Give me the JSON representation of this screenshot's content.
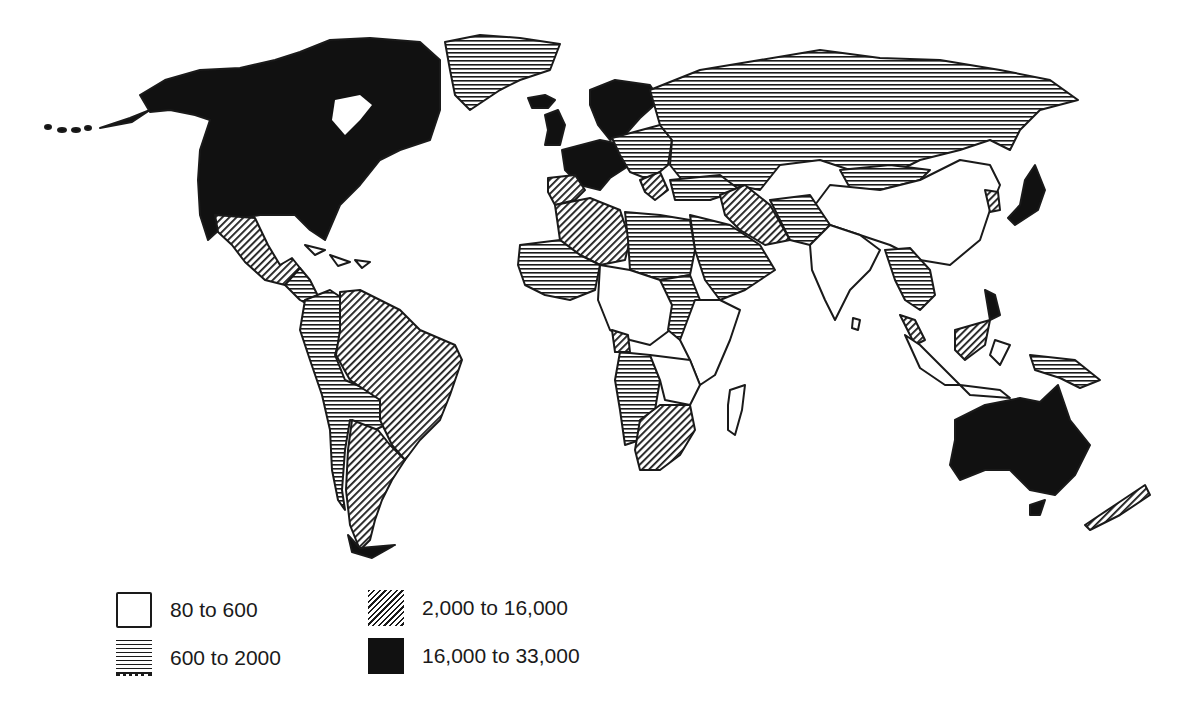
{
  "map": {
    "type": "choropleth world map",
    "classes": [
      {
        "id": "c1",
        "label": "80 to 600",
        "fill": "white",
        "color": "#ffffff"
      },
      {
        "id": "c2",
        "label": "600 to 2000",
        "fill": "horizontal-hatch",
        "color": "#1a1a1a"
      },
      {
        "id": "c3",
        "label": "2,000 to 16,000",
        "fill": "diagonal-hatch",
        "color": "#1a1a1a"
      },
      {
        "id": "c4",
        "label": "16,000 to 33,000",
        "fill": "solid-black",
        "color": "#111111"
      }
    ],
    "regions": {
      "north_america_us_canada": "16,000 to 33,000",
      "greenland": "600 to 2000",
      "mexico": "2,000 to 16,000",
      "central_america": "600 to 2000",
      "colombia_peru_bolivia": "600 to 2000",
      "brazil_venezuela": "2,000 to 16,000",
      "argentina_chile_uruguay": "2,000 to 16,000",
      "western_europe_scandinavia": "16,000 to 33,000",
      "eastern_europe": "600 to 2000",
      "iberia_balkans": "2,000 to 16,000",
      "ussr": "600 to 2000",
      "north_africa_algeria_libya": "2,000 to 16,000",
      "egypt_sudan_west_africa": "600 to 2000",
      "sub_saharan_africa": "80 to 600",
      "gabon": "2,000 to 16,000",
      "angola_namibia_botswana": "600 to 2000",
      "south_africa": "2,000 to 16,000",
      "middle_east_arabia": "600 to 2000",
      "iran_iraq": "2,000 to 16,000",
      "china_india": "80 to 600",
      "mongolia_korea_north": "600 to 2000",
      "japan": "16,000 to 33,000",
      "southeast_asia": "600 to 2000",
      "indonesia": "80 to 600",
      "australia": "16,000 to 33,000",
      "new_zealand": "2,000 to 16,000"
    }
  },
  "legend": {
    "items": [
      {
        "label": "80 to 600"
      },
      {
        "label": "600 to 2000"
      },
      {
        "label": "2,000 to 16,000"
      },
      {
        "label": "16,000 to 33,000"
      }
    ]
  }
}
